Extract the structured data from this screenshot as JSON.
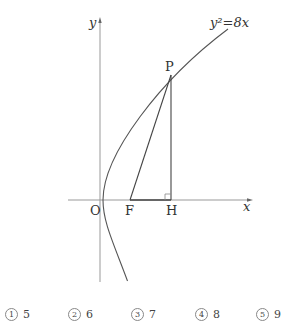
{
  "figure": {
    "curve_label": "y²=8x",
    "axis_x_label": "x",
    "axis_y_label": "y",
    "points": {
      "O": "O",
      "F": "F",
      "H": "H",
      "P": "P"
    }
  },
  "choices": [
    {
      "number": "1",
      "value": "5"
    },
    {
      "number": "2",
      "value": "6"
    },
    {
      "number": "3",
      "value": "7"
    },
    {
      "number": "4",
      "value": "8"
    },
    {
      "number": "5",
      "value": "9"
    }
  ]
}
